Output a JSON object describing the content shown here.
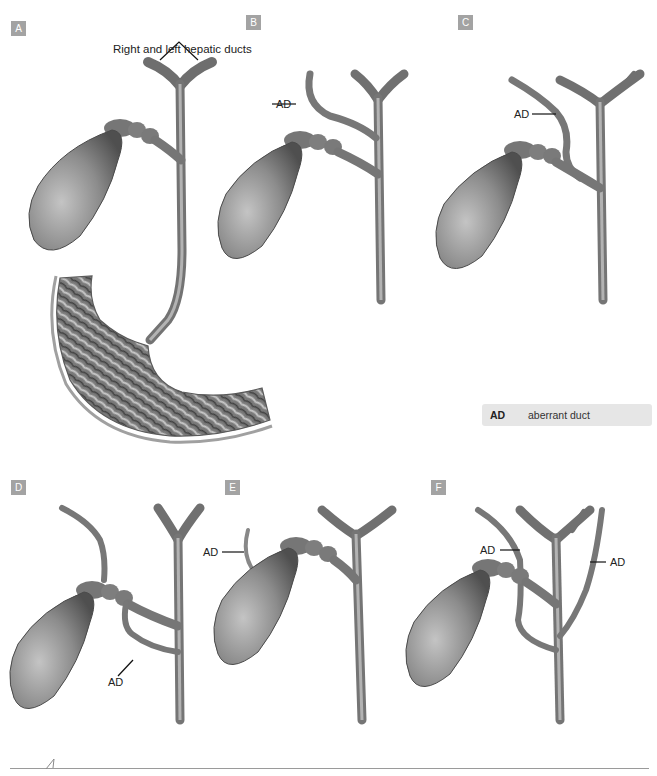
{
  "figure": {
    "panels": [
      {
        "id": "A",
        "label": "A",
        "caption": "Right and left hepatic ducts",
        "annotations": []
      },
      {
        "id": "B",
        "label": "B",
        "annotations": [
          "AD"
        ]
      },
      {
        "id": "C",
        "label": "C",
        "annotations": [
          "AD"
        ]
      },
      {
        "id": "D",
        "label": "D",
        "annotations": [
          "AD"
        ]
      },
      {
        "id": "E",
        "label": "E",
        "annotations": [
          "AD"
        ]
      },
      {
        "id": "F",
        "label": "F",
        "annotations": [
          "AD",
          "AD"
        ]
      }
    ],
    "legend": {
      "abbr": "AD",
      "description": "aberrant duct"
    },
    "colors": {
      "badge": "#a3a3a3",
      "legend_bg": "#e6e6e6",
      "duct": "#8a8a8a",
      "gallbladder": "#7d7d7d"
    }
  }
}
